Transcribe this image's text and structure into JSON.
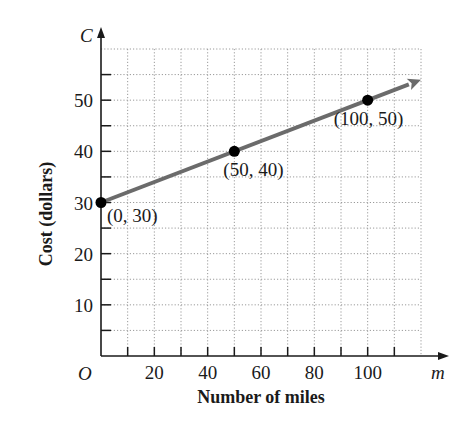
{
  "chart_data": {
    "type": "line",
    "title": "",
    "xlabel": "Number of miles",
    "ylabel": "Cost (dollars)",
    "x_variable": "m",
    "y_variable": "C",
    "origin_label": "O",
    "xlim": [
      0,
      120
    ],
    "ylim": [
      0,
      60
    ],
    "x_ticks": [
      10,
      20,
      30,
      40,
      50,
      60,
      70,
      80,
      90,
      100,
      110
    ],
    "x_tick_labels": [
      "20",
      "40",
      "60",
      "80",
      "100"
    ],
    "x_tick_label_values": [
      20,
      40,
      60,
      80,
      100
    ],
    "y_ticks": [
      5,
      10,
      15,
      20,
      25,
      30,
      35,
      40,
      45,
      50,
      55
    ],
    "y_tick_labels": [
      "10",
      "20",
      "30",
      "40",
      "50"
    ],
    "y_tick_label_values": [
      10,
      20,
      30,
      40,
      50
    ],
    "grid": true,
    "grid_style": "dotted",
    "grid_step_x": 10,
    "grid_step_y": 5,
    "legend": null,
    "series": [
      {
        "name": "Cost",
        "equation": "C = 0.2m + 30",
        "x": [
          0,
          50,
          100
        ],
        "y": [
          30,
          40,
          50
        ],
        "extends_to": [
          120,
          54
        ],
        "arrow_end": true,
        "color": "#6b6b6b"
      }
    ],
    "annotations": [
      {
        "text": "(0, 30)",
        "x": 0,
        "y": 30
      },
      {
        "text": "(50, 40)",
        "x": 50,
        "y": 40
      },
      {
        "text": "(100, 50)",
        "x": 100,
        "y": 50
      }
    ],
    "colors": {
      "axis": "#1a1a1a",
      "grid": "#9a9a9a",
      "line": "#6b6b6b",
      "points": "#000000",
      "text": "#1a1a1a"
    }
  }
}
